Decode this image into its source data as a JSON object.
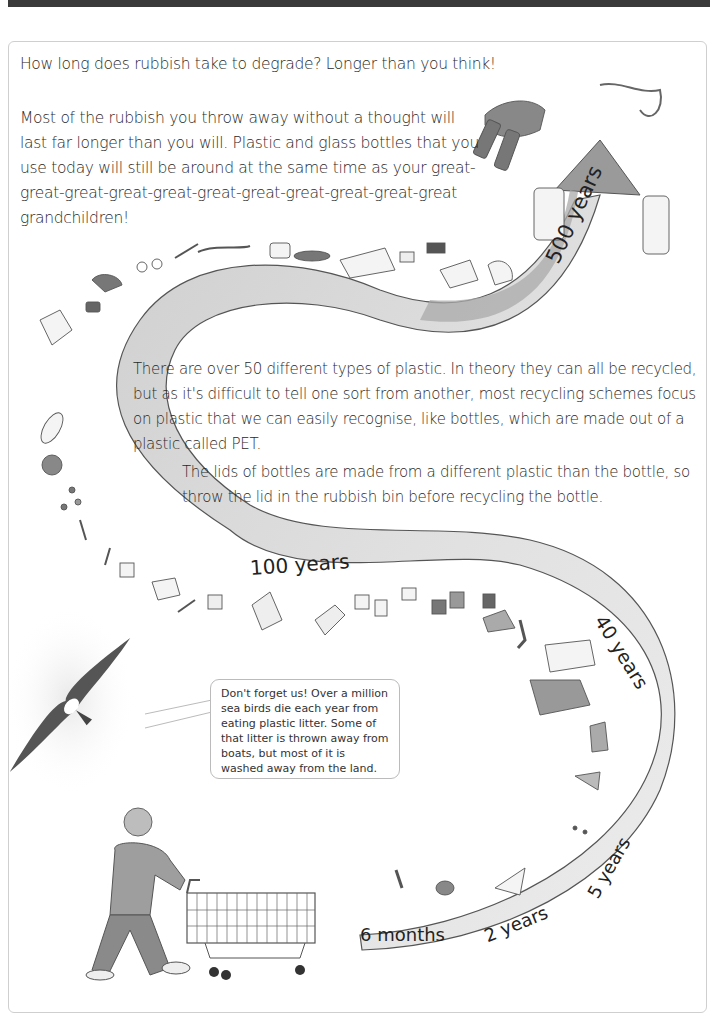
{
  "header": {
    "headline": "How long does rubbish take to degrade?  Longer than you think!"
  },
  "intro": {
    "text": "Most of the rubbish you throw away without a thought will last far longer than you will.  Plastic and glass bottles that you use today will still be around at the same time as your great-great-great-great-great-great-great-great-great-great-great grandchildren!"
  },
  "body": {
    "paragraph_1": "There are over 50 different types of plastic.  In theory they can all be recycled, but as it's difficult to tell one sort from another, most recycling schemes focus on plastic that we can easily recognise, like bottles, which are made out of a plastic called PET.",
    "paragraph_2": "The lids of bottles are made from a different plastic than the bottle, so throw the lid in the rubbish bin before recycling the bottle."
  },
  "speech_bubble": {
    "text": "Don't forget us!  Over a million sea birds die each year from eating plastic litter. Some of that litter is thrown away from boats, but most of it is washed away from the land."
  },
  "timeline": {
    "labels": [
      {
        "id": "six_months",
        "text": "6 months"
      },
      {
        "id": "two_years",
        "text": "2 years"
      },
      {
        "id": "five_years",
        "text": "5 years"
      },
      {
        "id": "forty_years",
        "text": "40 years"
      },
      {
        "id": "hundred_years",
        "text": "100 years"
      },
      {
        "id": "five_hundred_years",
        "text": "500 years"
      }
    ]
  },
  "illustrations": {
    "bottle_label": "ONE BEER",
    "items": [
      "apple core",
      "banana peel",
      "orange peel",
      "cigarette butts",
      "nappy",
      "plastic bag",
      "trousers",
      "striped t-shirt",
      "socks",
      "shoe",
      "tin cans",
      "cups",
      "carton",
      "drink cartons",
      "plastic tray",
      "spoon",
      "fork",
      "yoghurt pot",
      "buttons",
      "ball",
      "flip-flop",
      "sunglasses",
      "pen",
      "shoe",
      "rope",
      "glass bottles",
      "plastic bottle",
      "albatross",
      "boy with shopping trolley"
    ]
  },
  "colors": {
    "band": "#d9d9d9",
    "band_dark": "#9a9a9a",
    "text": "#2a2a2a",
    "topbar": "#3a3a3a"
  }
}
